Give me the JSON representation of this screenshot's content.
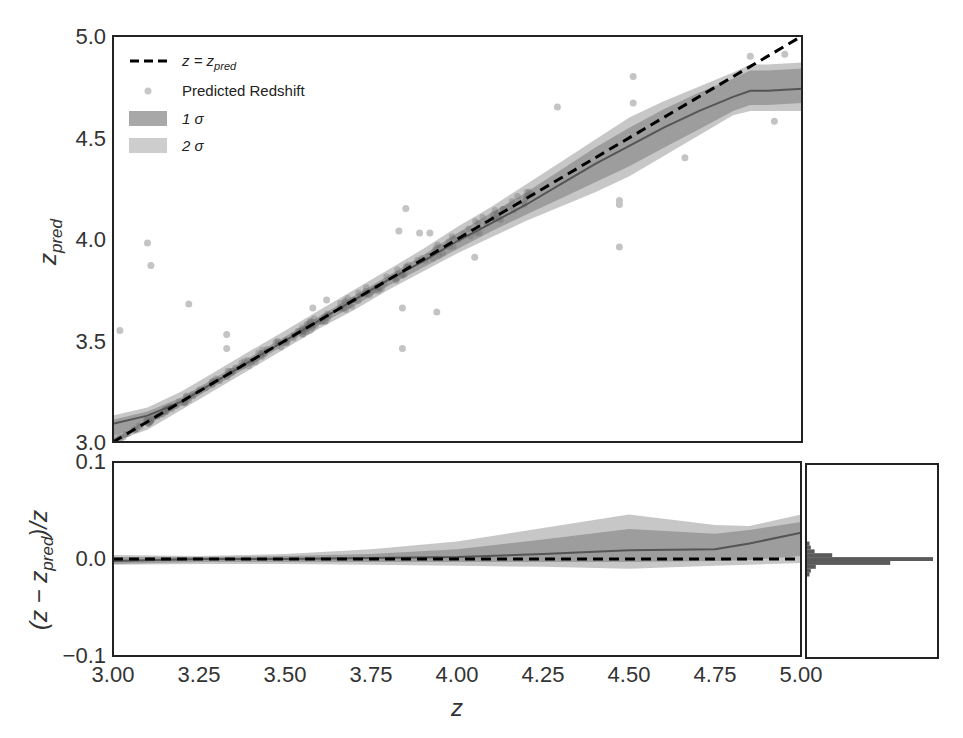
{
  "chart_data": [
    {
      "type": "scatter",
      "panel": "main",
      "xlabel": "z",
      "ylabel": "z_pred",
      "ylabel_main": "z",
      "ylabel_sub": "pred",
      "xlim": [
        3.0,
        5.0
      ],
      "ylim": [
        3.0,
        5.0
      ],
      "yticks": [
        3.0,
        3.5,
        4.0,
        4.5,
        5.0
      ],
      "ytick_labels": [
        "3.0",
        "3.5",
        "4.0",
        "4.5",
        "5.0"
      ],
      "grid": false,
      "legend_position": "top-left",
      "legend": [
        {
          "label_main": "z = z",
          "label_sub": "pred",
          "kind": "dashed-line"
        },
        {
          "label": "Predicted Redshift",
          "kind": "point"
        },
        {
          "label": "1 σ",
          "kind": "band-dark"
        },
        {
          "label": "2 σ",
          "kind": "band-light"
        }
      ],
      "identity_line": {
        "x": [
          3.0,
          5.0
        ],
        "y": [
          3.0,
          5.0
        ]
      },
      "band": {
        "z": [
          3.0,
          3.1,
          3.2,
          3.3,
          3.4,
          3.5,
          3.6,
          3.7,
          3.8,
          3.9,
          4.0,
          4.1,
          4.2,
          4.3,
          4.4,
          4.5,
          4.6,
          4.7,
          4.8,
          4.85,
          4.9,
          5.0
        ],
        "mean": [
          3.09,
          3.13,
          3.2,
          3.3,
          3.4,
          3.5,
          3.6,
          3.7,
          3.8,
          3.89,
          3.99,
          4.08,
          4.17,
          4.27,
          4.37,
          4.46,
          4.55,
          4.63,
          4.7,
          4.73,
          4.73,
          4.74
        ],
        "s1_lo": [
          3.03,
          3.09,
          3.18,
          3.28,
          3.38,
          3.48,
          3.58,
          3.67,
          3.77,
          3.86,
          3.95,
          4.04,
          4.12,
          4.2,
          4.28,
          4.36,
          4.45,
          4.54,
          4.63,
          4.66,
          4.66,
          4.67
        ],
        "s1_hi": [
          3.11,
          3.15,
          3.22,
          3.32,
          3.42,
          3.52,
          3.62,
          3.72,
          3.82,
          3.92,
          4.03,
          4.13,
          4.23,
          4.34,
          4.45,
          4.55,
          4.64,
          4.72,
          4.79,
          4.83,
          4.83,
          4.84
        ],
        "s2_lo": [
          3.0,
          3.06,
          3.16,
          3.26,
          3.36,
          3.46,
          3.56,
          3.65,
          3.75,
          3.84,
          3.93,
          4.01,
          4.09,
          4.16,
          4.23,
          4.31,
          4.41,
          4.51,
          4.61,
          4.63,
          4.63,
          4.63
        ],
        "s2_hi": [
          3.13,
          3.17,
          3.25,
          3.35,
          3.45,
          3.55,
          3.65,
          3.75,
          3.85,
          3.95,
          4.06,
          4.16,
          4.27,
          4.38,
          4.49,
          4.6,
          4.68,
          4.75,
          4.82,
          4.86,
          4.86,
          4.87
        ]
      },
      "outliers": {
        "x": [
          3.1,
          3.11,
          3.22,
          3.02,
          3.33,
          3.33,
          3.85,
          3.83,
          3.89,
          3.92,
          4.05,
          3.84,
          3.94,
          3.84,
          4.47,
          4.47,
          4.47,
          4.29,
          4.51,
          4.85,
          4.95,
          4.92,
          4.66,
          4.51,
          3.58,
          3.62
        ],
        "y": [
          3.98,
          3.87,
          3.68,
          3.55,
          3.53,
          3.46,
          4.15,
          4.04,
          4.03,
          4.03,
          3.91,
          3.66,
          3.64,
          3.46,
          4.17,
          3.96,
          4.19,
          4.65,
          4.67,
          4.9,
          4.91,
          4.58,
          4.4,
          4.8,
          3.66,
          3.7
        ]
      }
    },
    {
      "type": "area",
      "panel": "residual",
      "xlabel": "z",
      "ylabel": "(z − z_pred)/z",
      "ylabel_pre": "(z − z",
      "ylabel_sub": "pred",
      "ylabel_post": ")/z",
      "xlim": [
        3.0,
        5.0
      ],
      "ylim": [
        -0.1,
        0.1
      ],
      "xticks": [
        3.0,
        3.25,
        3.5,
        3.75,
        4.0,
        4.25,
        4.5,
        4.75,
        5.0
      ],
      "xtick_labels": [
        "3.00",
        "3.25",
        "3.50",
        "3.75",
        "4.00",
        "4.25",
        "4.50",
        "4.75",
        "5.00"
      ],
      "yticks": [
        -0.1,
        0.0,
        0.1
      ],
      "ytick_labels": [
        "−0.1",
        "0.0",
        "0.1"
      ],
      "zero_line": 0.0,
      "band": {
        "z": [
          3.0,
          3.25,
          3.5,
          3.75,
          4.0,
          4.25,
          4.5,
          4.75,
          4.85,
          5.0
        ],
        "mean": [
          -0.002,
          0.0,
          0.0,
          0.001,
          0.002,
          0.005,
          0.009,
          0.01,
          0.016,
          0.027
        ],
        "s1_lo": [
          -0.005,
          -0.003,
          -0.003,
          -0.003,
          -0.003,
          -0.003,
          -0.003,
          -0.002,
          -0.001,
          0.003
        ],
        "s1_hi": [
          0.002,
          0.002,
          0.003,
          0.005,
          0.01,
          0.02,
          0.031,
          0.026,
          0.03,
          0.038
        ],
        "s2_lo": [
          -0.006,
          -0.005,
          -0.005,
          -0.006,
          -0.007,
          -0.008,
          -0.01,
          -0.007,
          -0.006,
          -0.004
        ],
        "s2_hi": [
          0.004,
          0.003,
          0.005,
          0.01,
          0.018,
          0.032,
          0.046,
          0.035,
          0.034,
          0.046
        ]
      }
    },
    {
      "type": "bar",
      "panel": "histogram",
      "orientation": "horizontal",
      "ylim": [
        -0.1,
        0.1
      ],
      "bins": [
        -0.014,
        -0.01,
        -0.006,
        -0.002,
        0.002,
        0.006,
        0.01,
        0.014,
        0.018
      ],
      "counts": [
        0.02,
        0.03,
        0.07,
        0.66,
        1.0,
        0.2,
        0.06,
        0.03,
        0.02
      ]
    }
  ],
  "colors": {
    "band_1sigma": "#8f8f8f",
    "band_2sigma": "#bdbdbd",
    "mean_line": "#555555",
    "identity_line": "#000000",
    "points": "#c4c4c4",
    "hist": "#5a5a5a",
    "frame": "#222222"
  }
}
